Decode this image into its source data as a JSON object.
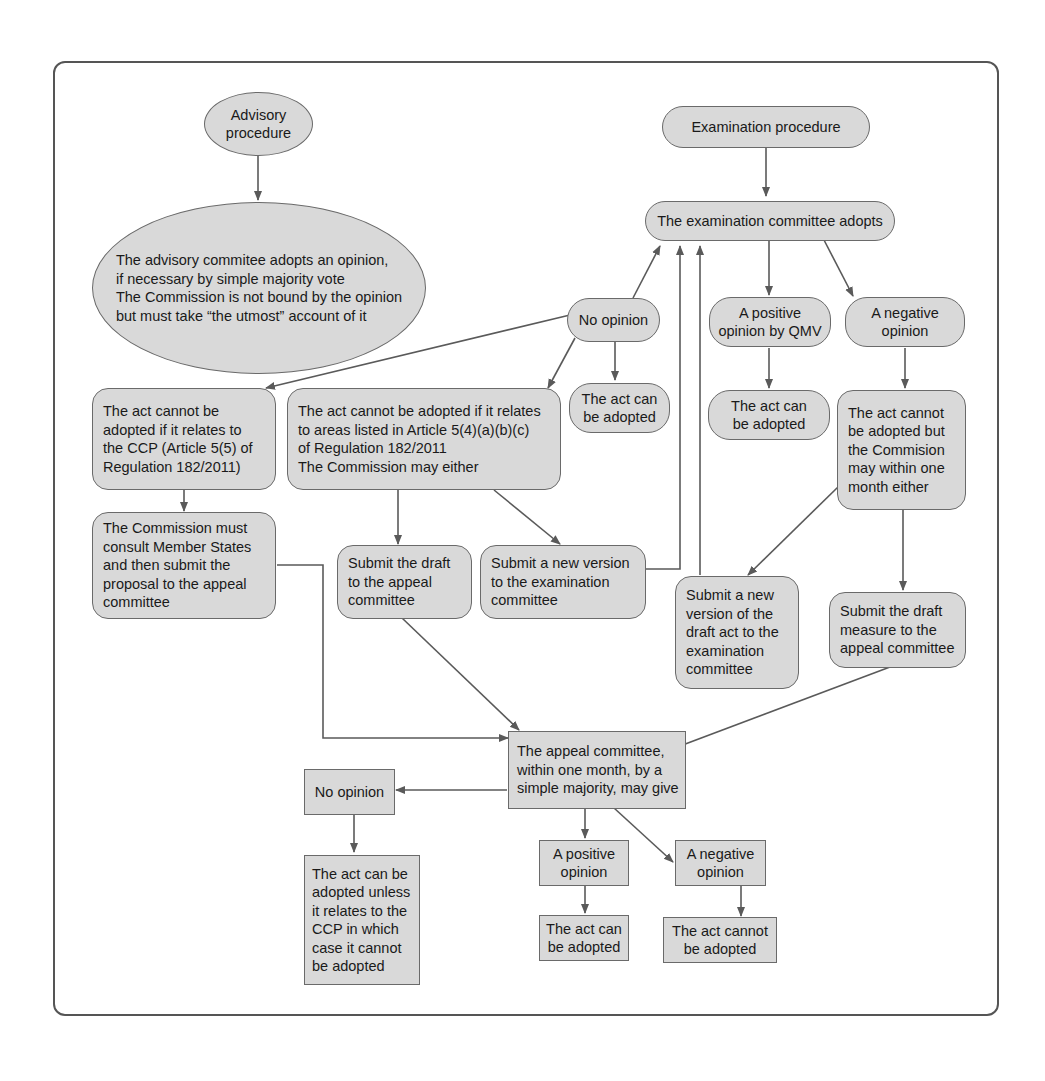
{
  "diagram": {
    "colors": {
      "node_fill": "#d9d9d9",
      "stroke": "#6a6a6a",
      "text": "#1a1a1a"
    },
    "advisory": {
      "start": "Advisory\nprocedure",
      "adopts": "The advisory commitee adopts an opinion,\nif necessary by simple majority vote\nThe Commission is not bound by the opinion\nbut must take “the utmost” account of it"
    },
    "examination": {
      "start": "Examination procedure",
      "adopts": "The examination committee adopts",
      "no_opinion": "No opinion",
      "positive": "A positive\nopinion by QMV",
      "negative": "A negative\nopinion",
      "no_opinion_can_adopt": "The act can\nbe adopted",
      "positive_can_adopt": "The act can\nbe adopted",
      "ccp_cannot": "The act cannot be\nadopted if it relates to\nthe CCP (Article 5(5) of\nRegulation 182/2011)",
      "areas_cannot": "The act cannot be adopted if it relates\nto areas listed in Article 5(4)(a)(b)(c)\nof Regulation 182/2011\nThe Commission may either",
      "negative_cannot": "The act cannot\nbe adopted but\nthe Commision\nmay within one\nmonth either",
      "consult": "The Commission must\nconsult Member States\nand then submit the\nproposal to the appeal\ncommittee",
      "submit_draft_appeal": "Submit the draft\nto the appeal\ncommittee",
      "submit_new_version": "Submit a new version\nto the examination\ncommittee",
      "submit_new_version_draft": "Submit a new\nversion of the\ndraft act to the\nexamination\ncommittee",
      "submit_draft_measure": "Submit the draft\nmeasure to the\nappeal committee"
    },
    "appeal": {
      "committee": "The appeal committee,\nwithin one month, by a\nsimple majority, may give",
      "no_opinion": "No opinion",
      "no_opinion_result": "The act can be\nadopted unless\nit relates to the\nCCP in which\ncase it cannot\nbe adopted",
      "positive": "A positive\nopinion",
      "positive_result": "The act can\nbe adopted",
      "negative": "A negative\nopinion",
      "negative_result": "The act cannot\nbe adopted"
    }
  }
}
